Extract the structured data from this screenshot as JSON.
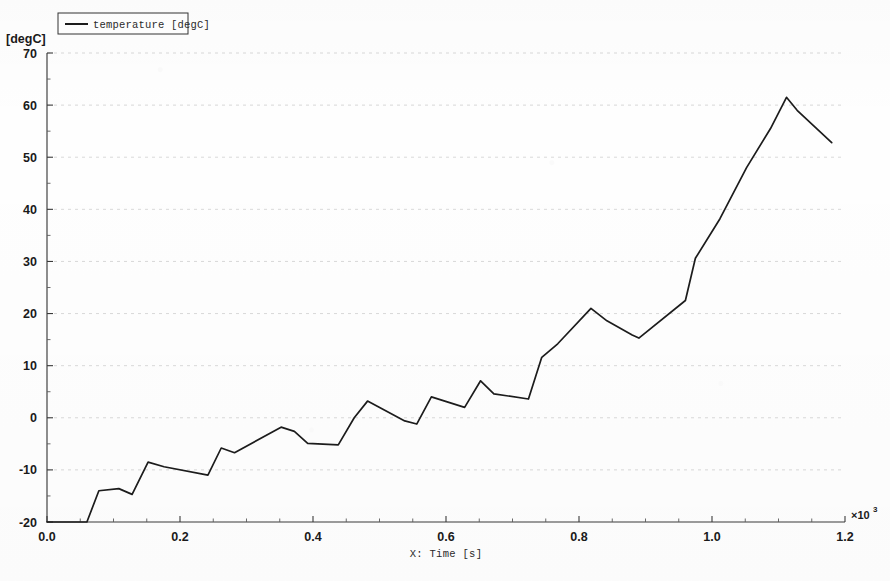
{
  "chart_data": {
    "type": "line",
    "title": "",
    "xlabel": "X: Time [s]",
    "ylabel": "[degC]",
    "x_exponent_label": "×10",
    "x_exponent_power": "3",
    "xlim": [
      0.0,
      1.2
    ],
    "ylim": [
      -20,
      70
    ],
    "xticks": [
      "0.0",
      "0.2",
      "0.4",
      "0.6",
      "0.8",
      "1.0",
      "1.2"
    ],
    "xtick_values": [
      0.0,
      0.2,
      0.4,
      0.6,
      0.8,
      1.0,
      1.2
    ],
    "yticks": [
      "-20",
      "-10",
      "0",
      "10",
      "20",
      "30",
      "40",
      "50",
      "60",
      "70"
    ],
    "ytick_values": [
      -20,
      -10,
      0,
      10,
      20,
      30,
      40,
      50,
      60,
      70
    ],
    "x_minor_step": 0.05,
    "y_minor_step": 5,
    "grid": "dotted-horizontal",
    "legend_position": "top-left",
    "legend": [
      {
        "name": "temperature [degC]",
        "color": "#1c1c1c"
      }
    ],
    "series": [
      {
        "name": "temperature [degC]",
        "color": "#1c1c1c",
        "x": [
          0.0,
          0.06,
          0.078,
          0.108,
          0.128,
          0.152,
          0.176,
          0.242,
          0.262,
          0.282,
          0.352,
          0.372,
          0.392,
          0.438,
          0.462,
          0.482,
          0.538,
          0.556,
          0.578,
          0.628,
          0.652,
          0.672,
          0.724,
          0.744,
          0.768,
          0.818,
          0.842,
          0.88,
          0.89,
          0.96,
          0.975,
          1.012,
          1.052,
          1.088,
          1.112,
          1.128,
          1.18
        ],
        "y": [
          -20.0,
          -20.0,
          -14.0,
          -13.6,
          -14.7,
          -8.5,
          -9.4,
          -11.0,
          -5.8,
          -6.7,
          -1.8,
          -2.6,
          -4.9,
          -5.2,
          0.0,
          3.2,
          -0.6,
          -1.2,
          4.0,
          2.0,
          7.1,
          4.6,
          3.6,
          11.6,
          14.2,
          21.0,
          18.6,
          15.9,
          15.3,
          22.5,
          30.6,
          38.2,
          48.0,
          55.5,
          61.5,
          59.0,
          52.8
        ]
      }
    ],
    "annotations": []
  },
  "plot_geometry": {
    "left": 47,
    "right": 845,
    "top": 53,
    "bottom": 522
  }
}
